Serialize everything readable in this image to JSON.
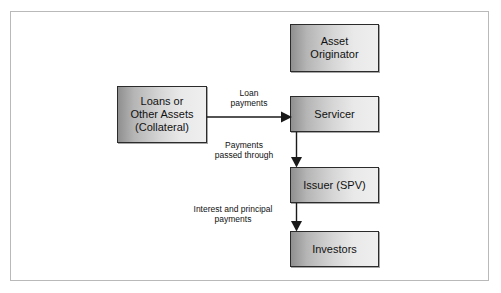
{
  "figure": {
    "kind": "flow-diagram",
    "frame_border_color": "#b9b9b9",
    "node_border_color": "#2b2b2b",
    "node_fill_light": "#efefef",
    "node_fill_dark": "#8f8f8f",
    "text_color": "#111111",
    "arrow_color": "#1a1a1a"
  },
  "nodes": {
    "asset_originator": {
      "id": "asset-originator",
      "lines": [
        "Asset",
        "Originator"
      ]
    },
    "loans": {
      "id": "loans-or-other-assets",
      "lines": [
        "Loans or",
        "Other Assets",
        "(Collateral)"
      ]
    },
    "servicer": {
      "id": "servicer",
      "lines": [
        "Servicer"
      ]
    },
    "issuer": {
      "id": "issuer-spv",
      "lines": [
        "Issuer (SPV)"
      ]
    },
    "investors": {
      "id": "investors",
      "lines": [
        "Investors"
      ]
    }
  },
  "edges": {
    "loans_to_servicer": {
      "id": "loan-payments",
      "direction": "right",
      "lines": [
        "Loan",
        "payments"
      ]
    },
    "servicer_to_issuer": {
      "id": "payments-passed-through",
      "direction": "down",
      "lines": [
        "Payments",
        "passed through"
      ]
    },
    "issuer_to_investors": {
      "id": "interest-and-principal-payments",
      "direction": "down",
      "lines": [
        "Interest and principal",
        "payments"
      ]
    }
  }
}
